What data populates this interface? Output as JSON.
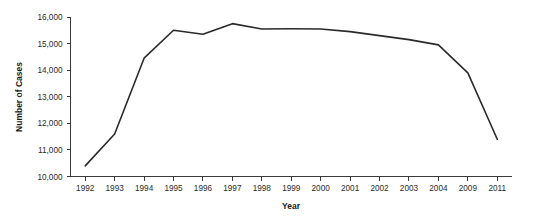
{
  "chart_data": {
    "type": "line",
    "title": "",
    "subtitle": "",
    "xlabel": "Year",
    "ylabel": "Number of Cases",
    "categories": [
      "1992",
      "1993",
      "1994",
      "1995",
      "1996",
      "1997",
      "1998",
      "1999",
      "2000",
      "2001",
      "2002",
      "2003",
      "2004",
      "2009",
      "2011"
    ],
    "values": [
      10400,
      11600,
      14450,
      15500,
      15350,
      15750,
      15550,
      15560,
      15550,
      15450,
      15300,
      15150,
      14950,
      13900,
      11400
    ],
    "series": [
      {
        "name": "Number of Cases",
        "values": [
          10400,
          11600,
          14450,
          15500,
          15350,
          15750,
          15550,
          15560,
          15550,
          15450,
          15300,
          15150,
          14950,
          13900,
          11400
        ],
        "color": "#2a2a2a"
      }
    ],
    "ylim": [
      10000,
      16000
    ],
    "ytick_values": [
      10000,
      11000,
      12000,
      13000,
      14000,
      15000,
      16000
    ],
    "ytick_labels": [
      "10,000",
      "11,000",
      "12,000",
      "13,000",
      "14,000",
      "15,000",
      "16,000"
    ],
    "xtick_labels": [
      "1992",
      "1993",
      "1994",
      "1995",
      "1996",
      "1997",
      "1998",
      "1999",
      "2000",
      "2001",
      "2002",
      "2003",
      "2004",
      "2009",
      "2011"
    ],
    "grid": false,
    "legend": false,
    "legend_position": "none",
    "axis_spines": [
      "left",
      "bottom"
    ],
    "tick_direction": "out",
    "x_scale": "categorical",
    "annotations": []
  },
  "colors": {
    "line": "#2a2a2a",
    "axis": "#3a3a3a",
    "text": "#1a1a1a",
    "background": "#ffffff"
  }
}
